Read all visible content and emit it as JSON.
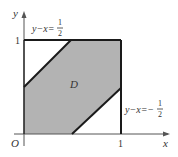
{
  "diagram": {
    "axes": {
      "x_label": "x",
      "y_label": "y",
      "origin_label": "O",
      "x_tick_label": "1",
      "y_tick_label": "1"
    },
    "region": {
      "label": "D",
      "vertices": [
        [
          0,
          0
        ],
        [
          0.5,
          0
        ],
        [
          1,
          0.5
        ],
        [
          1,
          1
        ],
        [
          0.5,
          1
        ],
        [
          0,
          0.5
        ]
      ],
      "fill": "#b3b3b3"
    },
    "lines": [
      {
        "name": "upper",
        "equation_lhs": "y−x=",
        "sign": "",
        "num": "1",
        "den": "2",
        "from": [
          0,
          0.5
        ],
        "to": [
          0.5,
          1
        ]
      },
      {
        "name": "lower",
        "equation_lhs": "y−x=−",
        "sign": "−",
        "num": "1",
        "den": "2",
        "from": [
          0.5,
          0
        ],
        "to": [
          1,
          0.5
        ]
      }
    ],
    "square": {
      "from": [
        0,
        0
      ],
      "to": [
        1,
        1
      ]
    },
    "colors": {
      "stroke": "#1a1a1a",
      "fill": "#b3b3b3",
      "text": "#333333"
    }
  }
}
